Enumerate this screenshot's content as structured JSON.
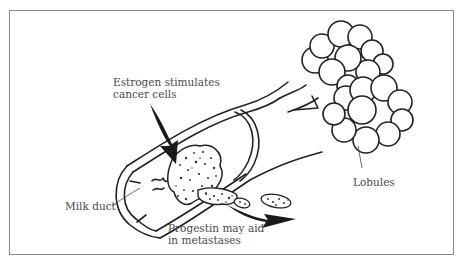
{
  "diagram": {
    "labels": {
      "estrogen_line1": "Estrogen stimulates",
      "estrogen_line2": "cancer cells",
      "milk_duct": "Milk duct",
      "progestin_line1": "Progestin may aid",
      "progestin_line2": "in metastases",
      "lobules": "Lobules"
    },
    "colors": {
      "border": "#8a8a8a",
      "ink": "#222222",
      "label_text": "#4a4a4a",
      "arrow_fill": "#1a1a1a"
    }
  }
}
